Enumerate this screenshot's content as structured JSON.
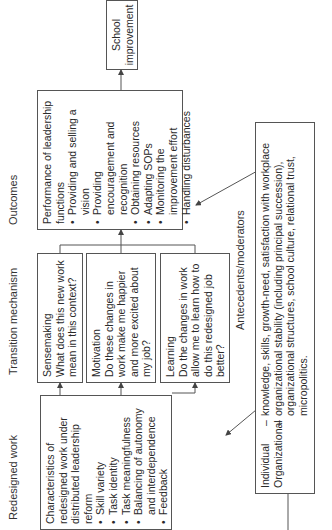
{
  "headers": {
    "redesigned": "Redesigned work",
    "transition": "Transition mechanism",
    "outcomes": "Outcomes",
    "antecedents": "Antecedents/moderators"
  },
  "redesigned_box": {
    "title": "Characteristics of redesigned work under distributed leadership reform",
    "items": [
      "Skill variety",
      "Task identity",
      "Task meaningfulness",
      "Balancing of autonomy and interdependence",
      "Feedback"
    ]
  },
  "transition_boxes": [
    {
      "title": "Sensemaking",
      "question": "What does this new work mean in this context?"
    },
    {
      "title": "Motivation",
      "question": "Do these changes in work make me happier and more excited about my job?"
    },
    {
      "title": "Learning",
      "question": "Do the changes in work allow me to learn how to do this redesigned job better?"
    }
  ],
  "outcomes_box": {
    "title": "Performance of leadership functions",
    "items": [
      "Providing and selling a vision",
      "Providing encouragement and recognition",
      "Obtaining resources",
      "Adapting SOPs",
      "Monitoring the improvement effort",
      "Handling disturbances"
    ]
  },
  "school_box": {
    "label": "School improvement"
  },
  "antecedents_box": {
    "rows": [
      {
        "label": "Individual",
        "dash": "–",
        "text": "knowledge, skills, growth-need, satisfaction with workplace"
      },
      {
        "label": "Organizational",
        "dash": "–",
        "text": "organizational stability (including principal succession), organizational structures, school culture, relational trust, micropolitics."
      }
    ]
  }
}
